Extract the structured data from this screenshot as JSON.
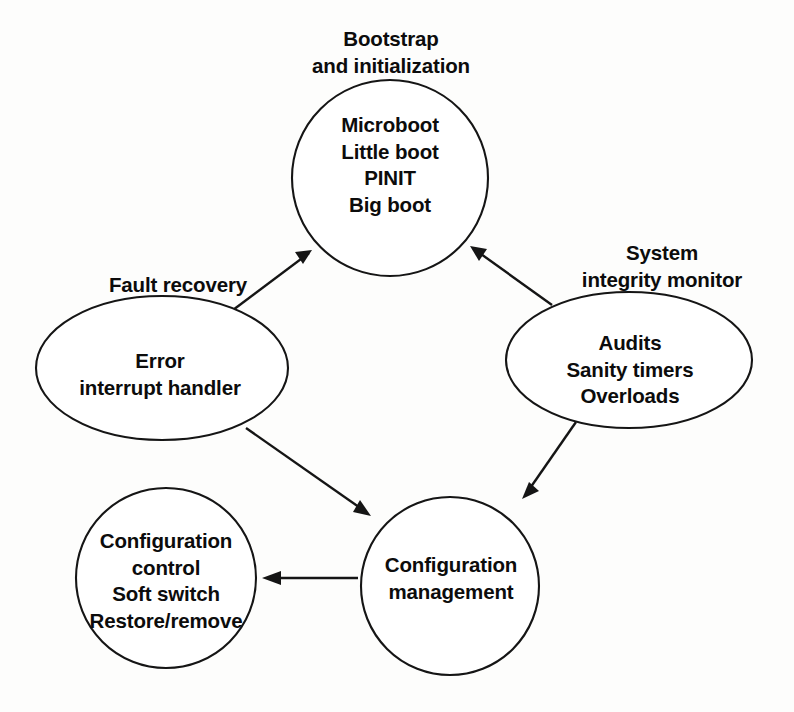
{
  "diagram": {
    "type": "cycle-diagram",
    "background_color": "#ffffff",
    "stroke_color": "#151515",
    "nodes": [
      {
        "id": "bootstrap",
        "shape": "circle",
        "caption": {
          "line1": "Bootstrap",
          "line2": "and initialization"
        },
        "body": {
          "line1": "Microboot",
          "line2": "Little boot",
          "line3": "PINIT",
          "line4": "Big boot"
        }
      },
      {
        "id": "fault-recovery",
        "shape": "ellipse",
        "caption": {
          "line1": "Fault recovery"
        },
        "body": {
          "line1": "Error",
          "line2": "interrupt handler"
        }
      },
      {
        "id": "system-integrity-monitor",
        "shape": "ellipse",
        "caption": {
          "line1": "System",
          "line2": "integrity monitor"
        },
        "body": {
          "line1": "Audits",
          "line2": "Sanity timers",
          "line3": "Overloads"
        }
      },
      {
        "id": "configuration-control",
        "shape": "circle",
        "body": {
          "line1": "Configuration",
          "line2": "control",
          "line3": "Soft switch",
          "line4": "Restore/remove"
        }
      },
      {
        "id": "configuration-management",
        "shape": "circle",
        "body": {
          "line1": "Configuration",
          "line2": "management"
        }
      }
    ],
    "edges": [
      {
        "id": "fault-to-bootstrap",
        "from": "fault-recovery",
        "to": "bootstrap",
        "style": "solid-arrow"
      },
      {
        "id": "monitor-to-bootstrap",
        "from": "system-integrity-monitor",
        "to": "bootstrap",
        "style": "solid-arrow"
      },
      {
        "id": "fault-to-config-management",
        "from": "fault-recovery",
        "to": "configuration-management",
        "style": "solid-arrow"
      },
      {
        "id": "monitor-to-config-management",
        "from": "system-integrity-monitor",
        "to": "configuration-management",
        "style": "solid-arrow"
      },
      {
        "id": "config-management-to-config-control",
        "from": "configuration-management",
        "to": "configuration-control",
        "style": "solid-arrow"
      }
    ]
  }
}
